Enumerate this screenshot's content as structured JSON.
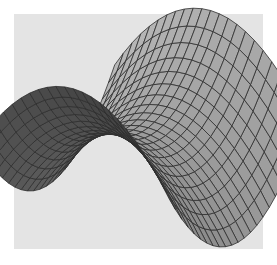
{
  "figure": {
    "background_color": "#ffffff",
    "panel_color": "#e4e4e4",
    "surface_light": "#a8a8a8",
    "surface_mid": "#7c7c7c",
    "surface_dark": "#1e1e1e",
    "mesh_line_color": "#2e2e2e",
    "grid_u": 22,
    "grid_v": 22
  }
}
